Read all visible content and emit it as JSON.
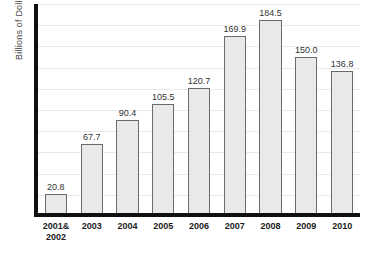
{
  "chart_data": {
    "type": "bar",
    "title": "",
    "xlabel": "",
    "ylabel": "Billions of Dollars",
    "categories": [
      "2001&\n2002",
      "2003",
      "2004",
      "2005",
      "2006",
      "2007",
      "2008",
      "2009",
      "2010"
    ],
    "category_lines": [
      [
        "2001&",
        "2002"
      ],
      [
        "2003",
        ""
      ],
      [
        "2004",
        ""
      ],
      [
        "2005",
        ""
      ],
      [
        "2006",
        ""
      ],
      [
        "2007",
        ""
      ],
      [
        "2008",
        ""
      ],
      [
        "2009",
        ""
      ],
      [
        "2010",
        ""
      ]
    ],
    "values": [
      20.8,
      67.7,
      90.4,
      105.5,
      120.7,
      169.9,
      184.5,
      150.0,
      136.8
    ],
    "value_labels": [
      "20.8",
      "67.7",
      "90.4",
      "105.5",
      "120.7",
      "169.9",
      "184.5",
      "150.0",
      "136.8"
    ],
    "ylim": [
      0,
      200
    ],
    "grid": true,
    "grid_step": 20,
    "gridline_count": 10,
    "legend": "none",
    "bar_fill_color": "#e9e9e9",
    "bar_border_color": "#6b6b6b",
    "axis_color": "#101010",
    "gridline_color": "#e9e9e9",
    "label_text_color": "#333333"
  }
}
